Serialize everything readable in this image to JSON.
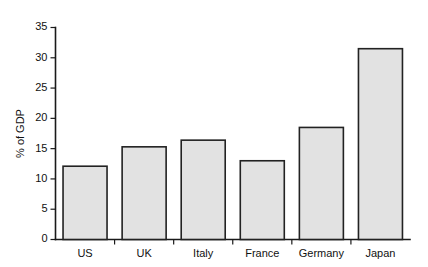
{
  "chart_data": {
    "type": "bar",
    "title": "",
    "subtitle": "",
    "xlabel": "",
    "ylabel": "% of GDP",
    "categories": [
      "US",
      "UK",
      "Italy",
      "France",
      "Germany",
      "Japan"
    ],
    "values": [
      12.1,
      15.3,
      16.4,
      13.0,
      18.5,
      31.5
    ],
    "series": [
      {
        "name": "% of GDP",
        "values": [
          12.1,
          15.3,
          16.4,
          13.0,
          18.5,
          31.5
        ]
      }
    ],
    "ylim": [
      0,
      35
    ],
    "yticks": [
      0,
      5,
      10,
      15,
      20,
      25,
      30,
      35
    ],
    "ytick_labels": [
      "0",
      "5",
      "10",
      "15",
      "20",
      "25",
      "30",
      "35"
    ],
    "grid": false,
    "legend": false,
    "legend_position": "none",
    "annotations": [],
    "colors": {
      "bar_fill": "#e2e2e2",
      "bar_edge": "#222222",
      "axis": "#1a1a1a",
      "text": "#111111",
      "background": "#ffffff"
    }
  }
}
